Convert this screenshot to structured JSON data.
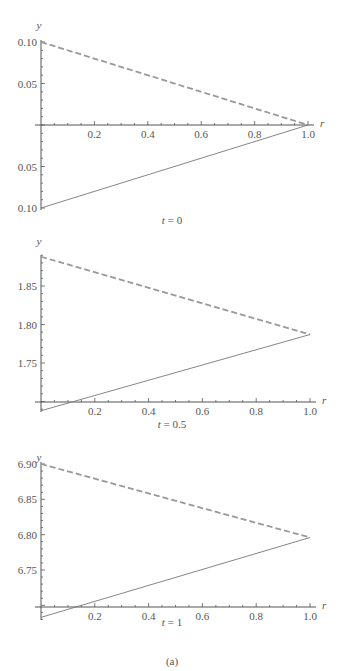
{
  "figure": {
    "caption": "(a)"
  },
  "chart_data": [
    {
      "type": "line",
      "title": "t = 0",
      "title_var": "t",
      "title_value": "0",
      "xlabel": "r",
      "ylabel": "y",
      "xlim": [
        0,
        1.0
      ],
      "ylim": [
        -0.1,
        0.1
      ],
      "x_axis_crosses_at_y": 0,
      "x_ticks": [
        0.2,
        0.4,
        0.6,
        0.8,
        1.0
      ],
      "x_tick_labels": [
        "0.2",
        "0.4",
        "0.6",
        "0.8",
        "1.0"
      ],
      "y_ticks": [
        0.1,
        0.05,
        -0.05,
        -0.1
      ],
      "y_tick_labels": [
        "0.10",
        "0.05",
        "0.05",
        "0.10"
      ],
      "grid": false,
      "legend": null,
      "series": [
        {
          "name": "upper (dashed)",
          "style": "dashed",
          "color": "#999999",
          "x": [
            0,
            1.0
          ],
          "y": [
            0.1,
            0.0
          ]
        },
        {
          "name": "lower (solid)",
          "style": "solid",
          "color": "#777777",
          "x": [
            0,
            1.0
          ],
          "y": [
            -0.1,
            0.0
          ]
        }
      ]
    },
    {
      "type": "line",
      "title": "t = 0.5",
      "title_var": "t",
      "title_value": "0.5",
      "xlabel": "r",
      "ylabel": "y",
      "xlim": [
        0,
        1.0
      ],
      "ylim": [
        1.688,
        1.888
      ],
      "x_axis_crosses_at_y": 1.7,
      "x_ticks": [
        0.2,
        0.4,
        0.6,
        0.8,
        1.0
      ],
      "x_tick_labels": [
        "0.2",
        "0.4",
        "0.6",
        "0.8",
        "1.0"
      ],
      "y_ticks": [
        1.85,
        1.8,
        1.75
      ],
      "y_tick_labels": [
        "1.85",
        "1.80",
        "1.75"
      ],
      "grid": false,
      "legend": null,
      "series": [
        {
          "name": "upper (dashed)",
          "style": "dashed",
          "color": "#999999",
          "x": [
            0,
            1.0
          ],
          "y": [
            1.888,
            1.787
          ]
        },
        {
          "name": "lower (solid)",
          "style": "solid",
          "color": "#777777",
          "x": [
            0,
            1.0
          ],
          "y": [
            1.688,
            1.787
          ]
        }
      ]
    },
    {
      "type": "line",
      "title": "t = 1",
      "title_var": "t",
      "title_value": "1",
      "xlabel": "r",
      "ylabel": "y",
      "xlim": [
        0,
        1.0
      ],
      "ylim": [
        6.683,
        6.9
      ],
      "x_axis_crosses_at_y": 6.7,
      "x_ticks": [
        0.2,
        0.4,
        0.6,
        0.8,
        1.0
      ],
      "x_tick_labels": [
        "0.2",
        "0.4",
        "0.6",
        "0.8",
        "1.0"
      ],
      "y_ticks": [
        6.9,
        6.85,
        6.8,
        6.75
      ],
      "y_tick_labels": [
        "6.90",
        "6.85",
        "6.80",
        "6.75"
      ],
      "grid": false,
      "legend": null,
      "series": [
        {
          "name": "upper (dashed)",
          "style": "dashed",
          "color": "#999999",
          "x": [
            0,
            1.0
          ],
          "y": [
            6.9,
            6.796
          ]
        },
        {
          "name": "lower (solid)",
          "style": "solid",
          "color": "#777777",
          "x": [
            0,
            1.0
          ],
          "y": [
            6.683,
            6.796
          ]
        }
      ]
    }
  ]
}
